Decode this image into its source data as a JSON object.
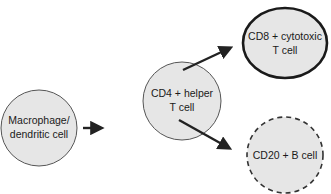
{
  "diagram": {
    "type": "flow",
    "colors": {
      "node_fill": "#e6e6e6",
      "stroke": "#2a2a2a",
      "arrow": "#222222",
      "background": "#ffffff"
    },
    "nodes": [
      {
        "id": "macrophage",
        "line1": "Macrophage/",
        "line2": "dendritic cell",
        "border": "thin"
      },
      {
        "id": "cd4",
        "line1": "CD4 + helper",
        "line2": "T cell",
        "border": "thin"
      },
      {
        "id": "cd8",
        "line1": "CD8 + cytotoxic",
        "line2": "T cell",
        "border": "thick"
      },
      {
        "id": "cd20",
        "line1": "CD20 + B cell",
        "line2": "",
        "border": "dashed"
      }
    ],
    "edges": [
      {
        "from": "macrophage",
        "to": "cd4"
      },
      {
        "from": "cd4",
        "to": "cd8"
      },
      {
        "from": "cd4",
        "to": "cd20"
      }
    ]
  }
}
